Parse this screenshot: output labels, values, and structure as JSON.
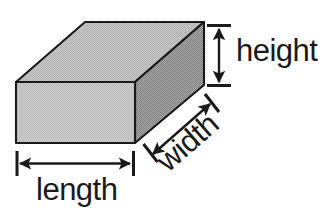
{
  "diagram": {
    "background_color": "#ffffff",
    "outline_color": "#1a1a1a",
    "labels": {
      "height": "height",
      "width": "width",
      "length": "length"
    },
    "faces": {
      "top": {
        "name": "top-face",
        "fill_color": "#c6c6c6",
        "points": "85,22 204,22 135,82 16,82"
      },
      "front": {
        "name": "front-face",
        "fill_color": "#d2d2d2",
        "points": "16,82 135,82 135,143 16,143"
      },
      "right": {
        "name": "right-face",
        "fill_color": "#9a9a9a",
        "points": "135,82 204,22 204,85 135,143"
      }
    },
    "dimension_lines": {
      "height": {
        "name": "height-dimension",
        "orientation": "vertical",
        "x": 219,
        "y_top": 27,
        "y_bottom": 84,
        "tick_top_y": 25,
        "tick_bottom_y": 86,
        "tick_x_start": 207,
        "tick_x_end": 231
      },
      "length": {
        "name": "length-dimension",
        "orientation": "horizontal",
        "y": 163,
        "x_left": 19,
        "x_right": 131,
        "tick_left_x": 17,
        "tick_right_x": 133,
        "tick_y_start": 151,
        "tick_y_end": 176
      },
      "width": {
        "name": "width-dimension",
        "orientation": "diagonal",
        "x_start": 154,
        "y_start": 153,
        "x_end": 211,
        "y_end": 103,
        "angle_deg": -41
      }
    },
    "label_positions": {
      "height": {
        "x": 236,
        "y": 60,
        "font_size": 30,
        "rotation": 0
      },
      "length": {
        "x": 37,
        "y": 199,
        "font_size": 30,
        "rotation": 0
      },
      "width": {
        "x": 168,
        "y": 172,
        "font_size": 30,
        "rotation": -41
      }
    }
  }
}
